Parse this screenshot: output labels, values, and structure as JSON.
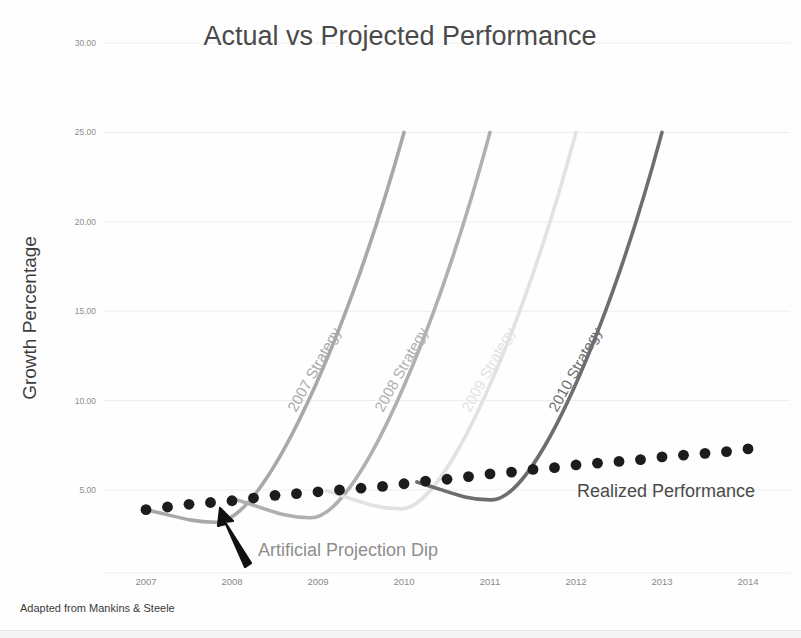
{
  "chart_data": {
    "type": "line",
    "title": "Actual vs Projected Performance",
    "xlabel": "",
    "ylabel": "Growth Percentage",
    "xlim": [
      2007,
      2014
    ],
    "ylim": [
      0,
      30
    ],
    "grid": true,
    "legend_position": "inline-labels",
    "x_ticks": [
      "2007",
      "2008",
      "2009",
      "2010",
      "2011",
      "2012",
      "2013",
      "2014"
    ],
    "y_ticks": [
      "5.00",
      "10.00",
      "15.00",
      "20.00",
      "25.00",
      "30.00"
    ],
    "y_tick_values": [
      5,
      10,
      15,
      20,
      25,
      30
    ],
    "source_note": "Adapted from Mankins & Steele",
    "annotations": [
      {
        "name": "artificial-projection-dip",
        "text": "Artificial Projection Dip",
        "arrow": true,
        "points_to_x": 2007.8,
        "points_to_y": 3.3
      },
      {
        "name": "realized-performance-label",
        "text": "Realized Performance",
        "arrow": false
      }
    ],
    "series": [
      {
        "name": "Realized Performance",
        "label": "Realized Performance",
        "style": "dotted",
        "color": "#1c1c1c",
        "x": [
          2007.0,
          2007.25,
          2007.5,
          2007.75,
          2008.0,
          2008.25,
          2008.5,
          2008.75,
          2009.0,
          2009.25,
          2009.5,
          2009.75,
          2010.0,
          2010.25,
          2010.5,
          2010.75,
          2011.0,
          2011.25,
          2011.5,
          2011.75,
          2012.0,
          2012.25,
          2012.5,
          2012.75,
          2013.0,
          2013.25,
          2013.5,
          2013.75,
          2014.0
        ],
        "values": [
          3.9,
          4.05,
          4.2,
          4.3,
          4.4,
          4.55,
          4.7,
          4.8,
          4.9,
          5.0,
          5.1,
          5.2,
          5.35,
          5.5,
          5.6,
          5.75,
          5.9,
          6.0,
          6.15,
          6.25,
          6.4,
          6.5,
          6.6,
          6.7,
          6.85,
          6.95,
          7.05,
          7.15,
          7.3
        ]
      },
      {
        "name": "2007 Strategy",
        "label": "2007 Strategy",
        "style": "solid",
        "color": "#a8a8a8",
        "start_year": 2007,
        "dip_year": 2007.8,
        "dip_value": 3.2,
        "start_value": 3.9,
        "end_year": 2010.0,
        "end_value": 25.0
      },
      {
        "name": "2008 Strategy",
        "label": "2008 Strategy",
        "style": "solid",
        "color": "#b0b0b0",
        "start_year": 2008.05,
        "dip_year": 2008.9,
        "dip_value": 3.45,
        "start_value": 4.45,
        "end_year": 2011.0,
        "end_value": 25.0
      },
      {
        "name": "2009 Strategy",
        "label": "2009 Strategy",
        "style": "solid",
        "color": "#e2e2e2",
        "start_year": 2009.1,
        "dip_year": 2009.95,
        "dip_value": 3.95,
        "start_value": 4.95,
        "end_year": 2012.0,
        "end_value": 25.0
      },
      {
        "name": "2010 Strategy",
        "label": "2010 Strategy",
        "style": "solid",
        "color": "#6e6e6e",
        "start_year": 2010.15,
        "dip_year": 2011.0,
        "dip_value": 4.45,
        "start_value": 5.45,
        "end_year": 2013.0,
        "end_value": 25.0
      }
    ]
  }
}
